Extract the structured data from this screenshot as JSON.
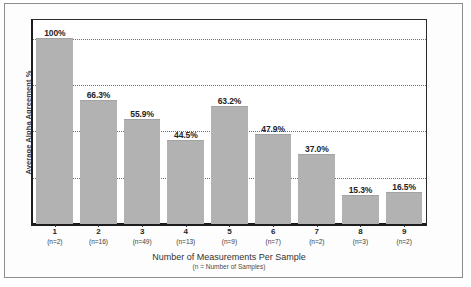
{
  "chart_data": {
    "type": "bar",
    "title": "",
    "xlabel": "Number of Measurements Per Sample",
    "xlabel_note": "(n = Number of Samples)",
    "ylabel": "Average Alpha Agreement %",
    "ylim": [
      0,
      110
    ],
    "grid": true,
    "gridlines": [
      25,
      50,
      75,
      100
    ],
    "y_tick_labels_visible": false,
    "legend": null,
    "categories": [
      "1",
      "2",
      "3",
      "4",
      "5",
      "6",
      "7",
      "8",
      "9"
    ],
    "values": [
      100,
      66.3,
      55.9,
      44.5,
      63.2,
      47.9,
      37.0,
      15.3,
      16.5
    ],
    "value_labels": [
      "100%",
      "66.3%",
      "55.9%",
      "44.5%",
      "63.2%",
      "47.9%",
      "37.0%",
      "15.3%",
      "16.5%"
    ],
    "sample_counts": [
      2,
      16,
      49,
      13,
      9,
      7,
      2,
      3,
      2
    ],
    "sample_count_labels": [
      "(n=2)",
      "(n=16)",
      "(n=49)",
      "(n=13)",
      "(n=9)",
      "(n=7)",
      "(n=2)",
      "(n=3)",
      "(n=2)"
    ],
    "bar_color": "#b2b2b2",
    "grid_color": "#6f6f6f",
    "axis_color": "#1c1c1c"
  }
}
